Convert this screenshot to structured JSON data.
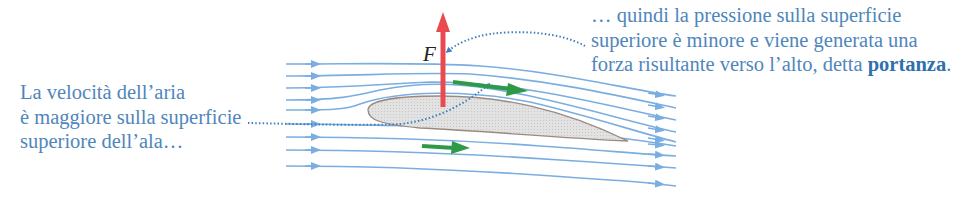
{
  "colors": {
    "streamline": "#7aaee0",
    "caption_text": "#4f86bb",
    "force_arrow": "#e84a4f",
    "velocity_arrow": "#2e9a47",
    "wing_fill": "#dcdcdc",
    "wing_stroke": "#9a8a80",
    "dotted_leader": "#3f7fc0"
  },
  "left_caption": {
    "line1": "La velocità dell’aria",
    "line2": "è maggiore sulla superficie",
    "line3": "superiore dell’ala…"
  },
  "right_caption": {
    "line1": "… quindi la pressione sulla superficie",
    "line2": "superiore è minore e viene generata una",
    "line3_prefix": "forza risultante verso l’alto, detta ",
    "line3_bold": "portanza",
    "line3_suffix": "."
  },
  "force": {
    "label": "F",
    "icon": "upward-red-arrow"
  },
  "diagram": {
    "elements": [
      "airfoil",
      "streamlines",
      "upper-velocity-arrow",
      "lower-velocity-arrow",
      "lift-force-arrow",
      "dotted-leader-lines"
    ],
    "streamline_count_left": 9,
    "streamline_count_right": 10
  }
}
